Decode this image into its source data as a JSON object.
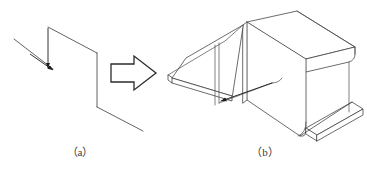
{
  "figure": {
    "kind": "engineering-illustration",
    "background_color": "#ffffff",
    "line_color": "#3b3b3b",
    "panel_a": {
      "caption": "（a）",
      "description": "2D wireframe Z-profile sketch with dimension arrows",
      "annotation_arrow_color": "#1c1c1c"
    },
    "transform_arrow": {
      "name": "block-arrow-right",
      "color": "#2b2b2b",
      "fill": "#ffffff"
    },
    "panel_b": {
      "caption": "（b）",
      "description": "3D isometric sheet-metal Z-bracket with material thickness",
      "face_fill": "#ffffff",
      "edge_color": "#3b3b3b"
    }
  }
}
